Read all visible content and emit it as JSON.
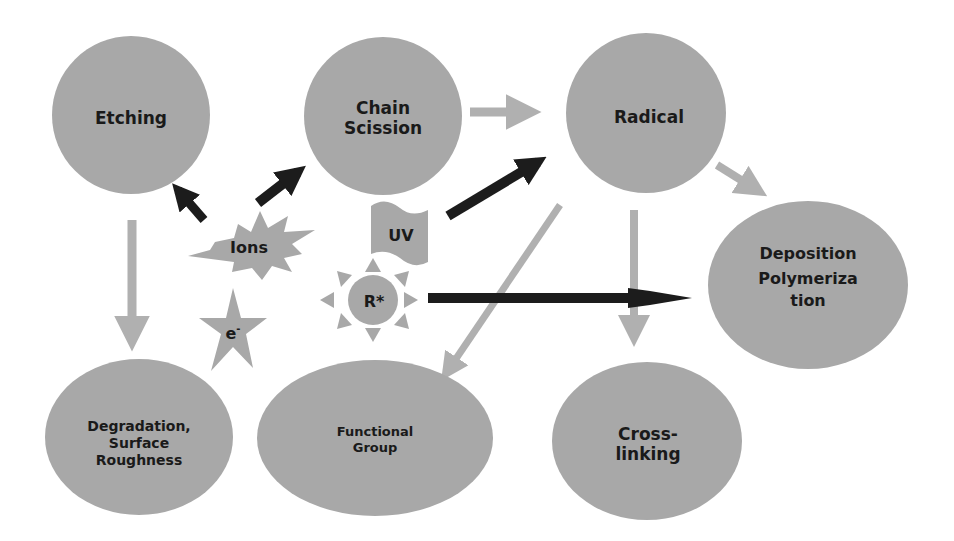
{
  "diagram": {
    "colors": {
      "node_fill": "#a8a8a8",
      "gray_arrow": "#b0b0b0",
      "dark_arrow": "#1c1c1c",
      "text": "#1a1a1a",
      "background": "#ffffff"
    },
    "nodes": {
      "etching": {
        "lines": [
          "Etching"
        ]
      },
      "chain_scission": {
        "lines": [
          "Chain",
          "Scission"
        ]
      },
      "radical": {
        "lines": [
          "Radical"
        ]
      },
      "deposition": {
        "lines": [
          "Deposition",
          "Polymeriza",
          "tion"
        ]
      },
      "degradation": {
        "lines": [
          "Degradation,",
          "Surface",
          "Roughness"
        ]
      },
      "functional_group": {
        "lines": [
          "Functional",
          "Group"
        ]
      },
      "crosslinking": {
        "lines": [
          "Cross-",
          "linking"
        ]
      }
    },
    "species": {
      "ions": {
        "label": "Ions",
        "shape": "burst"
      },
      "uv": {
        "label": "UV",
        "shape": "wave-flag"
      },
      "r_star": {
        "label": "R*",
        "shape": "sun"
      },
      "electron": {
        "label": "e",
        "superscript": "-",
        "shape": "five-point-star"
      }
    },
    "edges": [
      {
        "from": "Ions",
        "to": "Etching",
        "style": "dark"
      },
      {
        "from": "Ions",
        "to": "Chain Scission",
        "style": "dark"
      },
      {
        "from": "UV",
        "to": "Radical",
        "style": "dark"
      },
      {
        "from": "R*",
        "to": "Deposition Polymerization",
        "style": "dark"
      },
      {
        "from": "Chain Scission",
        "to": "Radical",
        "style": "gray"
      },
      {
        "from": "Radical",
        "to": "Deposition Polymerization",
        "style": "gray"
      },
      {
        "from": "Radical",
        "to": "Cross-linking",
        "style": "gray"
      },
      {
        "from": "Radical",
        "to": "Functional Group",
        "style": "gray"
      },
      {
        "from": "Etching",
        "to": "Degradation, Surface Roughness",
        "style": "gray"
      }
    ]
  }
}
